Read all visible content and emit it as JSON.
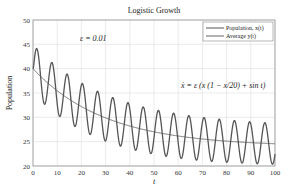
{
  "chart_data": {
    "type": "line",
    "title": "Logistic Growth",
    "xlabel": "t",
    "ylabel": "Population",
    "xlim": [
      0,
      100
    ],
    "ylim": [
      20,
      50
    ],
    "xticks": [
      0,
      10,
      20,
      30,
      40,
      50,
      60,
      70,
      80,
      90,
      100
    ],
    "yticks": [
      20,
      25,
      30,
      35,
      40,
      45,
      50
    ],
    "grid": true,
    "legend_position": "upper right",
    "annotations": [
      {
        "text": "ε = 0.01",
        "x": 20,
        "y": 46
      },
      {
        "text": "ẋ = ε (x (1 − x/20) + sin t)",
        "x": 76,
        "y": 39
      }
    ],
    "series": [
      {
        "name": "Population, x(t)",
        "description": "oscillating curve with period 2π around the average",
        "x": [
          0,
          1.6,
          4.7,
          7.9,
          11.0,
          14.1,
          17.3,
          20.4,
          23.6,
          26.7,
          29.8,
          33.0,
          36.1,
          39.3,
          42.4,
          45.6,
          48.7,
          51.8,
          55.0,
          58.1,
          61.3,
          64.4,
          67.5,
          70.7,
          73.8,
          77.0,
          80.1,
          83.3,
          86.4,
          89.5,
          92.7,
          95.8,
          99.0,
          100
        ],
        "values": [
          40.0,
          46.4,
          37.0,
          43.8,
          34.7,
          41.3,
          32.8,
          39.4,
          31.2,
          37.6,
          29.8,
          36.2,
          28.6,
          34.9,
          27.6,
          33.8,
          26.7,
          32.9,
          25.9,
          32.1,
          25.2,
          31.4,
          24.6,
          30.8,
          24.1,
          30.3,
          23.6,
          29.9,
          23.2,
          29.5,
          22.8,
          29.1,
          22.5,
          21.2
        ]
      },
      {
        "name": "Average y(t)",
        "x": [
          0,
          10,
          20,
          30,
          40,
          50,
          60,
          70,
          80,
          90,
          100
        ],
        "values": [
          40.0,
          36.0,
          33.0,
          31.0,
          29.3,
          28.0,
          26.9,
          26.0,
          25.2,
          24.6,
          24.0
        ]
      }
    ],
    "model": {
      "avg_start": 40,
      "avg_end": 24,
      "avg_tau": 30,
      "amp_start": 5.0,
      "amp_end": 4.2
    }
  },
  "legend": {
    "items": [
      {
        "label": "Population, x(t)"
      },
      {
        "label": "Average y(t)"
      }
    ]
  },
  "colors": {
    "population_line": "#555555",
    "average_line": "#666666",
    "grid": "#dddddd",
    "axis": "#888888"
  }
}
